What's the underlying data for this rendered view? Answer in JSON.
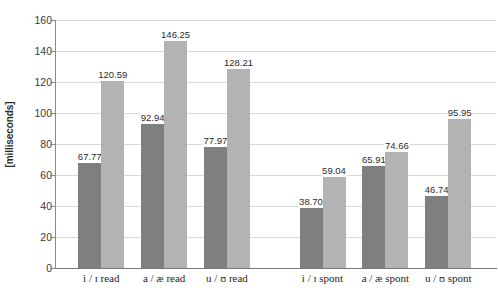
{
  "chart_data": {
    "type": "bar",
    "title": "",
    "subtitle": "",
    "xlabel": "",
    "ylabel": "[milliseconds]",
    "ylim": [
      0,
      160
    ],
    "yticks": [
      0,
      20,
      40,
      60,
      80,
      100,
      120,
      140,
      160
    ],
    "ytick_labels": [
      "0",
      "20",
      "40",
      "60",
      "80",
      "100",
      "120",
      "140",
      "160"
    ],
    "grid": "horizontal",
    "legend": "none",
    "categories": [
      "i / ɪ read",
      "a / æ read",
      "u / ʊ read",
      "i / ɪ spont",
      "a / æ spont",
      "u / ʊ spont"
    ],
    "series": [
      {
        "name": "first-vowel",
        "color": "#7f7f7f",
        "values": [
          67.77,
          92.94,
          77.97,
          38.7,
          65.91,
          46.74
        ],
        "value_labels": [
          "67.77",
          "92.94",
          "77.97",
          "38.70",
          "65.91",
          "46.74"
        ]
      },
      {
        "name": "second-vowel",
        "color": "#b3b3b3",
        "values": [
          120.59,
          146.25,
          128.21,
          59.04,
          74.66,
          95.95
        ],
        "value_labels": [
          "120.59",
          "146.25",
          "128.21",
          "59.04",
          "74.66",
          "95.95"
        ]
      }
    ],
    "group_gap_after_index": 2,
    "colors": {
      "series_dark": "#7f7f7f",
      "series_light": "#b3b3b3",
      "gridline": "#d9d9d9",
      "axis": "#8a8a8a",
      "background": "#ffffff",
      "text": "#2b2b2b"
    }
  }
}
